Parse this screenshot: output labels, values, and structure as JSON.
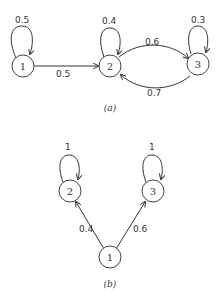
{
  "diagrams": [
    {
      "caption": "(a)",
      "nodes": [
        {
          "id": "1",
          "label": "1"
        },
        {
          "id": "2",
          "label": "2"
        },
        {
          "id": "3",
          "label": "3"
        }
      ],
      "edges": [
        {
          "from": "1",
          "to": "1",
          "label": "0.5"
        },
        {
          "from": "1",
          "to": "2",
          "label": "0.5"
        },
        {
          "from": "2",
          "to": "2",
          "label": "0.4"
        },
        {
          "from": "2",
          "to": "3",
          "label": "0.6"
        },
        {
          "from": "3",
          "to": "3",
          "label": "0.3"
        },
        {
          "from": "3",
          "to": "2",
          "label": "0.7"
        }
      ]
    },
    {
      "caption": "(b)",
      "nodes": [
        {
          "id": "1",
          "label": "1"
        },
        {
          "id": "2",
          "label": "2"
        },
        {
          "id": "3",
          "label": "3"
        }
      ],
      "edges": [
        {
          "from": "2",
          "to": "2",
          "label": "1"
        },
        {
          "from": "3",
          "to": "3",
          "label": "1"
        },
        {
          "from": "1",
          "to": "2",
          "label": "0.4"
        },
        {
          "from": "1",
          "to": "3",
          "label": "0.6"
        }
      ]
    }
  ]
}
